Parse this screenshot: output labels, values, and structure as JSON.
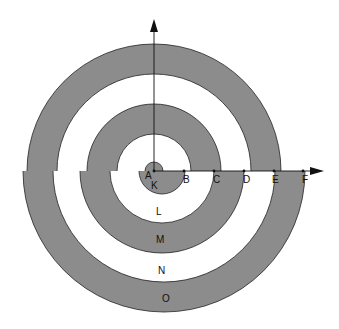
{
  "diagram": {
    "type": "spiral of semicircles",
    "colors": {
      "shade": "#8c8c8c",
      "background": "#ffffff",
      "stroke": "#222222"
    },
    "points": [
      {
        "label": "A",
        "x": 154,
        "y": 171
      },
      {
        "label": "B",
        "x": 184,
        "y": 171
      },
      {
        "label": "C",
        "x": 214,
        "y": 171
      },
      {
        "label": "D",
        "x": 244,
        "y": 171
      },
      {
        "label": "E",
        "x": 274,
        "y": 171
      },
      {
        "label": "F",
        "x": 303,
        "y": 171
      }
    ],
    "regions": [
      {
        "label": "K",
        "shaded": true
      },
      {
        "label": "L",
        "shaded": false
      },
      {
        "label": "M",
        "shaded": true
      },
      {
        "label": "N",
        "shaded": false
      },
      {
        "label": "O",
        "shaded": true
      }
    ],
    "axes": {
      "horizontal": "arrow to the right through A",
      "vertical": "arrow upward from A"
    }
  }
}
